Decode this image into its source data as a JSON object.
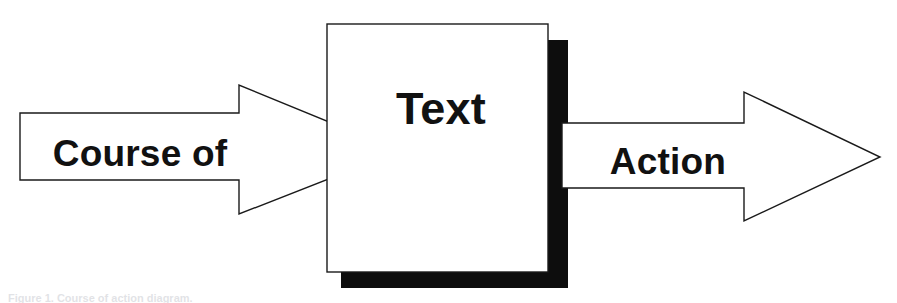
{
  "figure": {
    "type": "process-flow-diagram",
    "background_color": "#ffffff",
    "outline_color": "#1a1a1a",
    "shadow_color": "#0d0d0d",
    "text_color": "#111111",
    "caption_text": "Figure 1. Course of action diagram.",
    "caption_color": "#9fa3ad"
  },
  "nodes": {
    "input_arrow": {
      "label": "Course of",
      "shape": "block-arrow-right",
      "font_size": 37,
      "label_x": 140,
      "label_y": 166,
      "points": "20,113 239,113 239,85 400,151 239,214 239,180 20,180"
    },
    "process_box": {
      "label": "Text",
      "shape": "rectangle-with-drop-shadow",
      "font_size": 45,
      "label_x": 441,
      "label_y": 124,
      "rect_x": 327,
      "rect_y": 24,
      "rect_width": 221,
      "rect_height": 248,
      "shadow_offset_x": 14,
      "shadow_offset_y": 16,
      "shadow_right_points": "548,40 568,40 568,288 341,288 341,272 548,272",
      "shadow_right_x": 548,
      "shadow_right_y": 40,
      "shadow_right_width": 20,
      "shadow_bottom_x": 341,
      "shadow_bottom_y": 272,
      "shadow_bottom_width": 227,
      "shadow_bottom_height": 16
    },
    "output_arrow": {
      "label": "Action",
      "shape": "block-arrow-right",
      "font_size": 37,
      "label_x": 668,
      "label_y": 174,
      "points": "562,123 744,123 744,92 880,157 744,221 744,188 562,188"
    }
  }
}
